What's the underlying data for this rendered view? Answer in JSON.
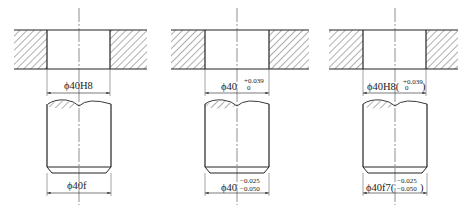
{
  "figure": {
    "line_color": "#222222",
    "panels": [
      {
        "hole": {
          "prefix": "ϕ40H8",
          "upper": "",
          "lower": ""
        },
        "shaft": {
          "prefix": "ϕ40f",
          "upper": "",
          "lower": ""
        }
      },
      {
        "hole": {
          "prefix": "ϕ40",
          "upper": "+0.039",
          "lower": "0"
        },
        "shaft": {
          "prefix": "ϕ40",
          "upper": "−0.025",
          "lower": "−0.050"
        }
      },
      {
        "hole": {
          "prefix": "ϕ40H8(",
          "upper": "+0.039",
          "lower": "0",
          "suffix": ")"
        },
        "shaft": {
          "prefix": "ϕ40f7(",
          "upper": "−0.025",
          "lower": "−0.050",
          "suffix": ")"
        }
      }
    ]
  }
}
